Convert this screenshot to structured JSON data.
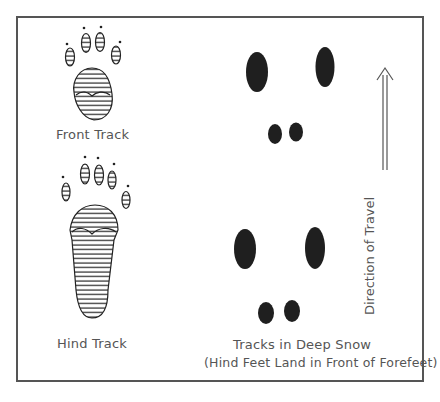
{
  "labels": {
    "front_track": "Front Track",
    "hind_track": "Hind Track",
    "deep_snow_title": "Tracks in Deep Snow",
    "deep_snow_subtitle": "(Hind Feet Land in Front of Forefeet)",
    "direction": "Direction of Travel"
  },
  "icons": {
    "front_paw": "front-paw-print",
    "hind_paw": "hind-paw-print",
    "arrow": "double-arrow-up"
  },
  "colors": {
    "ink": "#1a1a1a",
    "text": "#555555",
    "frame": "#555555"
  }
}
